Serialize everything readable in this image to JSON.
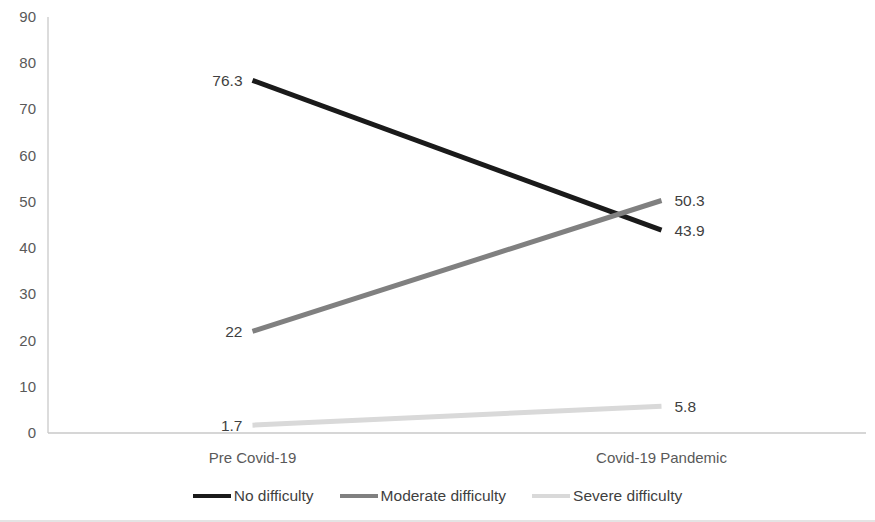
{
  "chart_data": {
    "type": "line",
    "categories": [
      "Pre Covid-19",
      "Covid-19 Pandemic"
    ],
    "series": [
      {
        "name": "No difficulty",
        "values": [
          76.3,
          43.9
        ],
        "color": "#1a1a1a"
      },
      {
        "name": "Moderate difficulty",
        "values": [
          22,
          50.3
        ],
        "color": "#808080"
      },
      {
        "name": "Severe difficulty",
        "values": [
          1.7,
          5.8
        ],
        "color": "#d9d9d9"
      }
    ],
    "title": "",
    "xlabel": "",
    "ylabel": "",
    "ylim": [
      0,
      90
    ],
    "ytick_step": 10,
    "ytick_labels": [
      "0",
      "10",
      "20",
      "30",
      "40",
      "50",
      "60",
      "70",
      "80",
      "90"
    ],
    "data_labels_shown": true,
    "grid": false,
    "legend_position": "bottom",
    "axis_color": "#c9c9c9",
    "tick_label_color": "#595959",
    "data_label_color": "#3f3f3f"
  }
}
